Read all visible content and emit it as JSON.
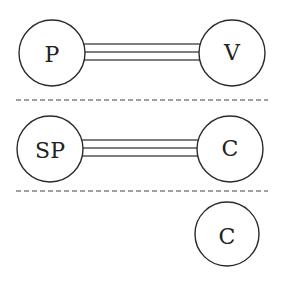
{
  "diagram": {
    "colors": {
      "stroke": "#2a2a2a",
      "bond": "#555555",
      "background": "#ffffff"
    },
    "rows": [
      {
        "left": {
          "label": "P",
          "cx": 52,
          "cy": 53,
          "r": 33
        },
        "right": {
          "label": "V",
          "cx": 232,
          "cy": 53,
          "r": 33
        },
        "bond": {
          "type": "triple",
          "y": [
            44,
            52,
            60
          ]
        }
      },
      {
        "left": {
          "label": "SP",
          "cx": 50,
          "cy": 149,
          "r": 33
        },
        "right": {
          "label": "C",
          "cx": 230,
          "cy": 149,
          "r": 33
        },
        "bond": {
          "type": "triple",
          "y": [
            140,
            148,
            156
          ]
        }
      },
      {
        "right": {
          "label": "C",
          "cx": 227,
          "cy": 234,
          "r": 32
        }
      }
    ],
    "dividers": [
      {
        "y": 100,
        "x1": 16,
        "x2": 268,
        "style": "dashed"
      },
      {
        "y": 191,
        "x1": 16,
        "x2": 268,
        "style": "dashed"
      }
    ]
  }
}
